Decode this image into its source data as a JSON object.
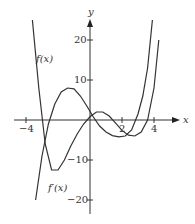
{
  "chart_data": {
    "type": "line",
    "title": "",
    "xlabel": "x",
    "ylabel": "y",
    "xlim": [
      -4.5,
      5.5
    ],
    "ylim": [
      -24,
      25
    ],
    "x_ticks": [
      -4,
      2,
      4
    ],
    "y_ticks": [
      20,
      10,
      -10,
      -20
    ],
    "x_tick_labels": [
      "−4",
      "2",
      "4"
    ],
    "y_tick_labels": [
      "20",
      "10",
      "−10",
      "−20"
    ],
    "series": [
      {
        "name": "f(x)",
        "x": [
          -3.6,
          -3.2,
          -2.8,
          -2.4,
          -2.0,
          -1.6,
          -1.2,
          -0.8,
          -0.4,
          0,
          0.4,
          0.8,
          1.2,
          1.6,
          2.0,
          2.4,
          2.8,
          3.2,
          3.6,
          4.0,
          4.3
        ],
        "y": [
          25,
          8,
          -6,
          -12.5,
          -12.5,
          -10,
          -6.5,
          -3.5,
          -1,
          0.8,
          2,
          2,
          1,
          -0.8,
          -2.6,
          -3.8,
          -4,
          -3,
          0,
          8,
          20
        ]
      },
      {
        "name": "f'(x)",
        "x": [
          -3.4,
          -3.0,
          -2.6,
          -2.2,
          -1.8,
          -1.4,
          -1.0,
          -0.6,
          -0.2,
          0.2,
          0.6,
          1.0,
          1.4,
          1.8,
          2.2,
          2.6,
          3.0,
          3.3,
          3.6,
          3.9
        ],
        "y": [
          -20,
          -9,
          -1,
          4,
          7,
          8,
          7.8,
          6,
          3.5,
          0.8,
          -1.5,
          -3,
          -3.9,
          -4.2,
          -4,
          -2.5,
          1.5,
          6,
          13,
          25
        ]
      }
    ],
    "annotations": [
      "f(x)",
      "f′(x)"
    ],
    "grid": false,
    "legend": "none"
  }
}
